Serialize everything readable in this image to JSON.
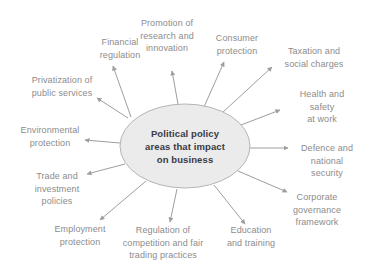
{
  "diagram": {
    "title": "Political policy areas that impact on business",
    "colors": {
      "background": "#ffffff",
      "label_text": "#8c8c8c",
      "center_text": "#3a3a45",
      "ellipse_fill": "#ebebeb",
      "ellipse_stroke": "#b5b5b5",
      "arrow": "#9e9e9e"
    },
    "center": {
      "label": "Political policy\nareas that impact\non business",
      "x": 185,
      "y": 146,
      "rx": 65,
      "ry": 42
    },
    "nodes": [
      {
        "id": "financial-regulation",
        "label": "Financial\nregulation",
        "x": 120,
        "y": 48,
        "arrow": {
          "x1": 131,
          "y1": 117,
          "x2": 113,
          "y2": 66
        }
      },
      {
        "id": "promotion-research-innovation",
        "label": "Promotion of\nresearch and\ninnovation",
        "x": 167,
        "y": 36,
        "arrow": {
          "x1": 178,
          "y1": 104,
          "x2": 172,
          "y2": 71
        }
      },
      {
        "id": "consumer-protection",
        "label": "Consumer\nprotection",
        "x": 237,
        "y": 44,
        "arrow": {
          "x1": 204,
          "y1": 107,
          "x2": 224,
          "y2": 62
        }
      },
      {
        "id": "taxation-social-charges",
        "label": "Taxation and\nsocial charges",
        "x": 314,
        "y": 57,
        "arrow": {
          "x1": 222,
          "y1": 113,
          "x2": 272,
          "y2": 67
        }
      },
      {
        "id": "health-safety-work",
        "label": "Health and safety\nat work",
        "x": 322,
        "y": 107,
        "arrow": {
          "x1": 241,
          "y1": 125,
          "x2": 280,
          "y2": 110
        }
      },
      {
        "id": "defence-national-security",
        "label": "Defence and\nnational\nsecurity",
        "x": 327,
        "y": 161,
        "arrow": {
          "x1": 250,
          "y1": 148,
          "x2": 288,
          "y2": 148
        }
      },
      {
        "id": "corporate-governance-framework",
        "label": "Corporate\ngovernance\nframework",
        "x": 317,
        "y": 210,
        "arrow": {
          "x1": 238,
          "y1": 171,
          "x2": 287,
          "y2": 192
        }
      },
      {
        "id": "education-training",
        "label": "Education\nand training",
        "x": 251,
        "y": 236,
        "arrow": {
          "x1": 214,
          "y1": 185,
          "x2": 245,
          "y2": 224
        }
      },
      {
        "id": "regulation-competition-trading",
        "label": "Regulation of\ncompetition and fair\ntrading practices",
        "x": 163,
        "y": 243,
        "arrow": {
          "x1": 177,
          "y1": 189,
          "x2": 170,
          "y2": 222
        }
      },
      {
        "id": "employment-protection",
        "label": "Employment\nprotection",
        "x": 80,
        "y": 235,
        "arrow": {
          "x1": 146,
          "y1": 181,
          "x2": 100,
          "y2": 220
        }
      },
      {
        "id": "trade-investment-policies",
        "label": "Trade and\ninvestment\npolicies",
        "x": 57,
        "y": 189,
        "arrow": {
          "x1": 125,
          "y1": 164,
          "x2": 87,
          "y2": 174
        }
      },
      {
        "id": "environmental-protection",
        "label": "Environmental\nprotection",
        "x": 50,
        "y": 136,
        "arrow": {
          "x1": 120,
          "y1": 143,
          "x2": 85,
          "y2": 140
        }
      },
      {
        "id": "privatization-public-services",
        "label": "Privatization of\npublic services",
        "x": 62,
        "y": 86,
        "arrow": {
          "x1": 128,
          "y1": 118,
          "x2": 97,
          "y2": 98
        }
      }
    ]
  }
}
